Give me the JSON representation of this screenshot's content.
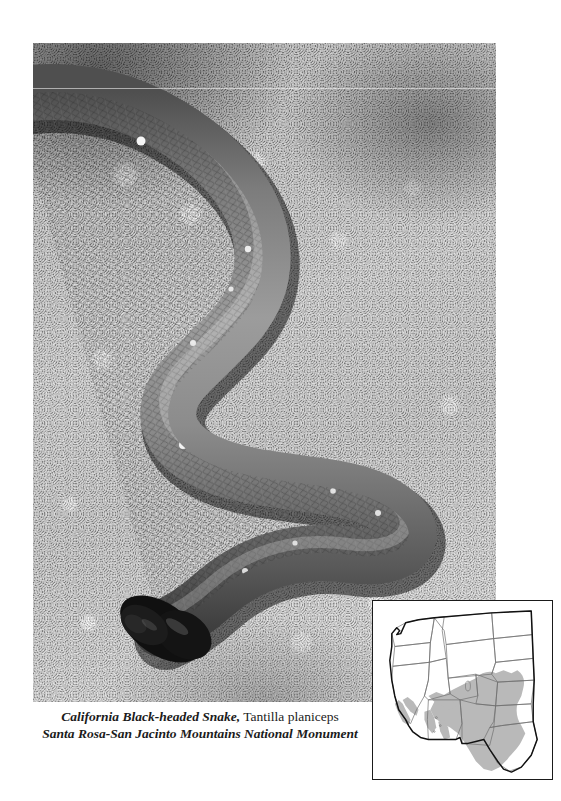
{
  "page": {
    "background_color": "#ffffff",
    "width": 561,
    "height": 801
  },
  "photo": {
    "alt_name": "california-black-headed-snake-photograph",
    "subject": "California Black-headed Snake",
    "description": "Grayscale photograph of a slender snake with a glossy black head coiled in an S-curve on coarse sandy granite gravel",
    "palette": {
      "snake_body": "#8a8a8a",
      "snake_head": "#141414",
      "ground_light": "#cfcfcf",
      "ground_mid": "#9a9a9a",
      "ground_dark": "#6f6f6f"
    }
  },
  "caption": {
    "line1_common_name": "California Black-headed Snake,",
    "line1_scientific_name": "Tantilla planiceps",
    "line2_location": "Santa Rosa-San Jacinto Mountains National Monument"
  },
  "range_map": {
    "name": "distribution-range-map",
    "region": "Western United States",
    "shaded_label": "species range",
    "colors": {
      "range_fill": "#b9b9b9",
      "state_border": "#6e6e6e",
      "country_border": "#111111",
      "map_background": "#ffffff",
      "frame": "#1a1a1a"
    },
    "states_shaded": [
      "Texas",
      "Oklahoma",
      "Kansas",
      "New Mexico",
      "Arizona",
      "southern California",
      "southwest Utah",
      "southern Nevada"
    ],
    "states_unshaded": [
      "Washington",
      "Oregon",
      "Idaho",
      "Montana",
      "Wyoming",
      "North Dakota",
      "South Dakota",
      "Nebraska",
      "Colorado",
      "northern California",
      "northern Nevada",
      "northern Utah"
    ]
  }
}
